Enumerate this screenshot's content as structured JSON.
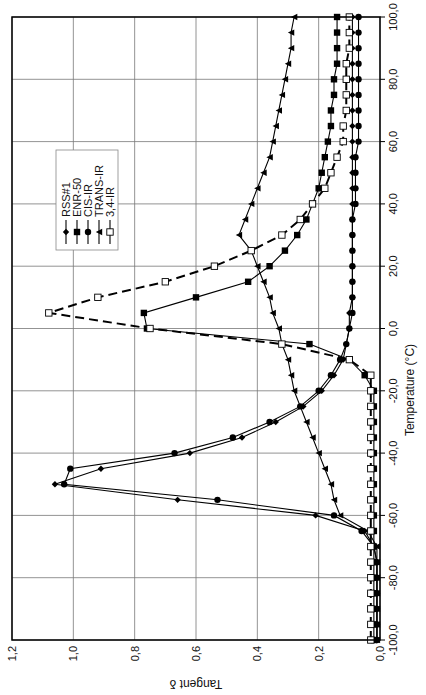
{
  "chart_data": {
    "type": "line",
    "title": "",
    "xlabel": "Temperature  (°C)",
    "ylabel": "Tangent δ",
    "xlim": [
      -100,
      100
    ],
    "ylim": [
      0,
      1.2
    ],
    "x_ticks": [
      "-100,0",
      "-80,0",
      "-60,0",
      "-40,0",
      "-20,0",
      "0,0",
      "20,0",
      "40,0",
      "60,0",
      "80,0",
      "100,0"
    ],
    "y_ticks": [
      "0,0",
      "0,2",
      "0,4",
      "0,6",
      "0,8",
      "1,0",
      "1,2"
    ],
    "grid": true,
    "orientation": "rotated 90° clockwise",
    "legend": {
      "position": "upper-left inside plot",
      "entries": [
        "RSS#1",
        "ENR-50",
        "CIS-IR",
        "TRANS-IR",
        "3,4-IR"
      ]
    },
    "series": [
      {
        "name": "RSS#1",
        "marker": "diamond",
        "line": "solid",
        "x": [
          -100,
          -95,
          -90,
          -85,
          -80,
          -75,
          -70,
          -65,
          -60,
          -55,
          -50,
          -45,
          -40,
          -35,
          -30,
          -25,
          -20,
          -15,
          -10,
          -5,
          0,
          5,
          10,
          15,
          20,
          25,
          30,
          35,
          40,
          45,
          50,
          55,
          60,
          65,
          70,
          75,
          80,
          85,
          90,
          95,
          100
        ],
        "y": [
          0.01,
          0.01,
          0.01,
          0.01,
          0.01,
          0.01,
          0.02,
          0.05,
          0.21,
          0.66,
          1.06,
          0.91,
          0.62,
          0.45,
          0.34,
          0.25,
          0.19,
          0.15,
          0.12,
          0.11,
          0.1,
          0.1,
          0.09,
          0.09,
          0.09,
          0.09,
          0.09,
          0.09,
          0.09,
          0.09,
          0.09,
          0.09,
          0.09,
          0.09,
          0.09,
          0.09,
          0.09,
          0.09,
          0.09,
          0.09,
          0.09
        ]
      },
      {
        "name": "ENR-50",
        "marker": "square",
        "line": "solid",
        "x": [
          -100,
          -95,
          -90,
          -85,
          -80,
          -75,
          -70,
          -65,
          -60,
          -55,
          -50,
          -45,
          -40,
          -35,
          -30,
          -25,
          -20,
          -15,
          -10,
          -5,
          0,
          5,
          10,
          15,
          20,
          25,
          30,
          35,
          40,
          45,
          50,
          55,
          60,
          65,
          70,
          75,
          80,
          85,
          90,
          95,
          100
        ],
        "y": [
          0.02,
          0.02,
          0.02,
          0.02,
          0.02,
          0.02,
          0.02,
          0.02,
          0.02,
          0.02,
          0.02,
          0.02,
          0.02,
          0.02,
          0.02,
          0.02,
          0.02,
          0.05,
          0.1,
          0.23,
          0.76,
          0.77,
          0.6,
          0.43,
          0.36,
          0.31,
          0.27,
          0.24,
          0.22,
          0.2,
          0.19,
          0.18,
          0.17,
          0.16,
          0.16,
          0.15,
          0.15,
          0.14,
          0.14,
          0.14,
          0.14
        ]
      },
      {
        "name": "CIS-IR",
        "marker": "circle",
        "line": "solid",
        "x": [
          -100,
          -95,
          -90,
          -85,
          -80,
          -75,
          -70,
          -65,
          -60,
          -55,
          -50,
          -45,
          -40,
          -35,
          -30,
          -25,
          -20,
          -15,
          -10,
          -5,
          0,
          5,
          10,
          15,
          20,
          25,
          30,
          35,
          40,
          45,
          50,
          55,
          60,
          65,
          70,
          75,
          80,
          85,
          90,
          95,
          100
        ],
        "y": [
          0.01,
          0.01,
          0.01,
          0.01,
          0.01,
          0.01,
          0.02,
          0.06,
          0.15,
          0.53,
          1.03,
          1.01,
          0.67,
          0.48,
          0.36,
          0.26,
          0.2,
          0.16,
          0.13,
          0.11,
          0.1,
          0.09,
          0.09,
          0.09,
          0.09,
          0.09,
          0.09,
          0.09,
          0.08,
          0.08,
          0.08,
          0.08,
          0.07,
          0.07,
          0.07,
          0.07,
          0.07,
          0.07,
          0.07,
          0.07,
          0.07
        ]
      },
      {
        "name": "TRANS-IR",
        "marker": "triangle",
        "line": "solid",
        "x": [
          -100,
          -95,
          -90,
          -85,
          -80,
          -75,
          -70,
          -65,
          -60,
          -55,
          -50,
          -45,
          -40,
          -35,
          -30,
          -25,
          -20,
          -15,
          -10,
          -5,
          0,
          5,
          10,
          15,
          20,
          25,
          30,
          35,
          40,
          45,
          50,
          55,
          60,
          65,
          70,
          75,
          80,
          85,
          90,
          95,
          100
        ],
        "y": [
          0.01,
          0.01,
          0.01,
          0.01,
          0.01,
          0.01,
          0.01,
          0.04,
          0.13,
          0.15,
          0.16,
          0.18,
          0.2,
          0.22,
          0.24,
          0.26,
          0.28,
          0.29,
          0.3,
          0.32,
          0.33,
          0.35,
          0.36,
          0.38,
          0.4,
          0.42,
          0.46,
          0.44,
          0.42,
          0.4,
          0.38,
          0.36,
          0.35,
          0.34,
          0.33,
          0.32,
          0.31,
          0.3,
          0.29,
          0.29,
          0.28
        ]
      },
      {
        "name": "3,4-IR",
        "marker": "open-square",
        "line": "dashed",
        "x": [
          -100,
          -95,
          -90,
          -85,
          -80,
          -75,
          -70,
          -65,
          -60,
          -55,
          -50,
          -45,
          -40,
          -35,
          -30,
          -25,
          -20,
          -15,
          -10,
          -5,
          0,
          5,
          10,
          15,
          20,
          25,
          30,
          35,
          40,
          45,
          50,
          55,
          60,
          65,
          70,
          75,
          80,
          85,
          90,
          95,
          100
        ],
        "y": [
          0.03,
          0.03,
          0.03,
          0.03,
          0.03,
          0.03,
          0.03,
          0.03,
          0.03,
          0.03,
          0.03,
          0.03,
          0.03,
          0.03,
          0.03,
          0.03,
          0.03,
          0.03,
          0.1,
          0.32,
          0.75,
          1.08,
          0.92,
          0.7,
          0.54,
          0.42,
          0.32,
          0.26,
          0.22,
          0.18,
          0.16,
          0.14,
          0.12,
          0.12,
          0.11,
          0.11,
          0.11,
          0.11,
          0.1,
          0.1,
          0.1
        ]
      }
    ]
  }
}
